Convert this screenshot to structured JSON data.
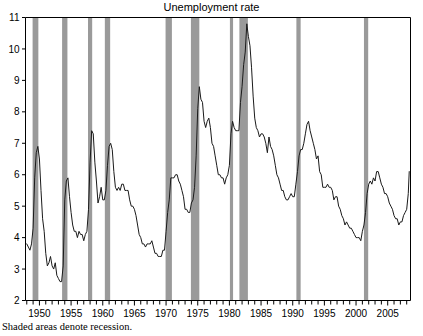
{
  "chart_title": "Unemployment rate",
  "caption": "Shaded areas denote recession.",
  "chart_data": {
    "type": "line",
    "title": "Unemployment rate",
    "subtitle": "",
    "xlabel": "",
    "ylabel": "",
    "xlim": [
      1947.8,
      2008.6
    ],
    "ylim": [
      2,
      11
    ],
    "grid": false,
    "legend": null,
    "annotations": [
      "Shaded areas denote recession."
    ],
    "y_ticks": [
      2,
      3,
      4,
      5,
      6,
      7,
      8,
      9,
      10,
      11
    ],
    "y_tick_labels": [
      "2",
      "3",
      "4",
      "5",
      "6",
      "7",
      "8",
      "9",
      "10",
      "11"
    ],
    "x_ticks_major": [
      1950,
      1955,
      1960,
      1965,
      1970,
      1975,
      1980,
      1985,
      1990,
      1995,
      2000,
      2005
    ],
    "x_tick_labels": [
      "1950",
      "1955",
      "1960",
      "1965",
      "1970",
      "1975",
      "1980",
      "1985",
      "1990",
      "1995",
      "2000",
      "2005"
    ],
    "x_minor_tick_interval": 1,
    "line_color": "#1a1a1a",
    "shade_color": "#9a9a9a",
    "axis_color": "#000000",
    "background_color": "#ffffff",
    "recession_bands": [
      {
        "label": "1948-49",
        "start": 1948.92,
        "end": 1949.83
      },
      {
        "label": "1953-54",
        "start": 1953.58,
        "end": 1954.42
      },
      {
        "label": "1957-58",
        "start": 1957.67,
        "end": 1958.33
      },
      {
        "label": "1960-61",
        "start": 1960.33,
        "end": 1961.17
      },
      {
        "label": "1969-70",
        "start": 1969.92,
        "end": 1970.92
      },
      {
        "label": "1973-75",
        "start": 1973.92,
        "end": 1975.25
      },
      {
        "label": "1980",
        "start": 1980.08,
        "end": 1980.58
      },
      {
        "label": "1981-82",
        "start": 1981.58,
        "end": 1982.92
      },
      {
        "label": "1990-91",
        "start": 1990.58,
        "end": 1991.25
      },
      {
        "label": "2001",
        "start": 2001.25,
        "end": 2001.92
      }
    ],
    "series": [
      {
        "name": "Unemployment rate",
        "x": [
          1948.0,
          1948.25,
          1948.5,
          1948.75,
          1949.0,
          1949.25,
          1949.5,
          1949.75,
          1950.0,
          1950.25,
          1950.5,
          1950.75,
          1951.0,
          1951.25,
          1951.5,
          1951.75,
          1952.0,
          1952.25,
          1952.5,
          1952.75,
          1953.0,
          1953.25,
          1953.5,
          1953.75,
          1954.0,
          1954.25,
          1954.5,
          1954.75,
          1955.0,
          1955.25,
          1955.5,
          1955.75,
          1956.0,
          1956.25,
          1956.5,
          1956.75,
          1957.0,
          1957.25,
          1957.5,
          1957.75,
          1958.0,
          1958.25,
          1958.5,
          1958.75,
          1959.0,
          1959.25,
          1959.5,
          1959.75,
          1960.0,
          1960.25,
          1960.5,
          1960.75,
          1961.0,
          1961.25,
          1961.5,
          1961.75,
          1962.0,
          1962.25,
          1962.5,
          1962.75,
          1963.0,
          1963.25,
          1963.5,
          1963.75,
          1964.0,
          1964.25,
          1964.5,
          1964.75,
          1965.0,
          1965.25,
          1965.5,
          1965.75,
          1966.0,
          1966.25,
          1966.5,
          1966.75,
          1967.0,
          1967.25,
          1967.5,
          1967.75,
          1968.0,
          1968.25,
          1968.5,
          1968.75,
          1969.0,
          1969.25,
          1969.5,
          1969.75,
          1970.0,
          1970.25,
          1970.5,
          1970.75,
          1971.0,
          1971.25,
          1971.5,
          1971.75,
          1972.0,
          1972.25,
          1972.5,
          1972.75,
          1973.0,
          1973.25,
          1973.5,
          1973.75,
          1974.0,
          1974.25,
          1974.5,
          1974.75,
          1975.0,
          1975.25,
          1975.5,
          1975.75,
          1976.0,
          1976.25,
          1976.5,
          1976.75,
          1977.0,
          1977.25,
          1977.5,
          1977.75,
          1978.0,
          1978.25,
          1978.5,
          1978.75,
          1979.0,
          1979.25,
          1979.5,
          1979.75,
          1980.0,
          1980.25,
          1980.5,
          1980.75,
          1981.0,
          1981.25,
          1981.5,
          1981.75,
          1982.0,
          1982.25,
          1982.5,
          1982.75,
          1983.0,
          1983.25,
          1983.5,
          1983.75,
          1984.0,
          1984.25,
          1984.5,
          1984.75,
          1985.0,
          1985.25,
          1985.5,
          1985.75,
          1986.0,
          1986.25,
          1986.5,
          1986.75,
          1987.0,
          1987.25,
          1987.5,
          1987.75,
          1988.0,
          1988.25,
          1988.5,
          1988.75,
          1989.0,
          1989.25,
          1989.5,
          1989.75,
          1990.0,
          1990.25,
          1990.5,
          1990.75,
          1991.0,
          1991.25,
          1991.5,
          1991.75,
          1992.0,
          1992.25,
          1992.5,
          1992.75,
          1993.0,
          1993.25,
          1993.5,
          1993.75,
          1994.0,
          1994.25,
          1994.5,
          1994.75,
          1995.0,
          1995.25,
          1995.5,
          1995.75,
          1996.0,
          1996.25,
          1996.5,
          1996.75,
          1997.0,
          1997.25,
          1997.5,
          1997.75,
          1998.0,
          1998.25,
          1998.5,
          1998.75,
          1999.0,
          1999.25,
          1999.5,
          1999.75,
          2000.0,
          2000.25,
          2000.5,
          2000.75,
          2001.0,
          2001.25,
          2001.5,
          2001.75,
          2002.0,
          2002.25,
          2002.5,
          2002.75,
          2003.0,
          2003.25,
          2003.5,
          2003.75,
          2004.0,
          2004.25,
          2004.5,
          2004.75,
          2005.0,
          2005.25,
          2005.5,
          2005.75,
          2006.0,
          2006.25,
          2006.5,
          2006.75,
          2007.0,
          2007.25,
          2007.5,
          2007.75,
          2008.0,
          2008.25,
          2008.4
        ],
        "values": [
          3.8,
          3.7,
          3.6,
          3.8,
          4.3,
          5.9,
          6.7,
          6.9,
          6.5,
          5.5,
          4.6,
          4.2,
          3.5,
          3.1,
          3.2,
          3.4,
          3.1,
          3.0,
          3.2,
          2.8,
          2.7,
          2.6,
          2.6,
          3.1,
          5.2,
          5.8,
          5.9,
          5.3,
          4.8,
          4.4,
          4.2,
          4.2,
          4.0,
          4.2,
          4.1,
          4.1,
          3.9,
          4.1,
          4.2,
          4.9,
          6.4,
          7.4,
          7.3,
          6.4,
          5.8,
          5.1,
          5.3,
          5.6,
          5.2,
          5.2,
          5.5,
          6.3,
          6.9,
          7.0,
          6.8,
          6.1,
          5.6,
          5.5,
          5.6,
          5.5,
          5.7,
          5.7,
          5.5,
          5.5,
          5.5,
          5.2,
          5.0,
          5.0,
          4.9,
          4.7,
          4.4,
          4.1,
          4.0,
          3.8,
          3.8,
          3.7,
          3.8,
          3.8,
          3.8,
          3.9,
          3.7,
          3.5,
          3.5,
          3.4,
          3.4,
          3.4,
          3.6,
          3.6,
          4.2,
          4.8,
          5.2,
          5.9,
          5.9,
          5.9,
          6.0,
          6.0,
          5.8,
          5.7,
          5.5,
          5.3,
          4.9,
          4.9,
          4.8,
          4.8,
          5.1,
          5.2,
          5.6,
          6.6,
          8.1,
          8.8,
          8.4,
          8.3,
          7.7,
          7.5,
          7.7,
          7.8,
          7.5,
          7.0,
          6.9,
          6.6,
          6.3,
          6.0,
          6.0,
          5.9,
          5.9,
          5.7,
          5.9,
          6.0,
          6.3,
          7.3,
          7.7,
          7.5,
          7.4,
          7.4,
          7.4,
          8.3,
          8.8,
          9.5,
          9.9,
          10.8,
          10.4,
          10.1,
          9.4,
          8.5,
          7.8,
          7.5,
          7.4,
          7.2,
          7.3,
          7.3,
          7.2,
          7.0,
          6.7,
          7.2,
          6.9,
          6.8,
          6.6,
          6.3,
          6.0,
          5.9,
          5.7,
          5.5,
          5.5,
          5.3,
          5.2,
          5.2,
          5.3,
          5.4,
          5.3,
          5.3,
          5.7,
          6.1,
          6.6,
          6.8,
          6.8,
          7.0,
          7.3,
          7.6,
          7.7,
          7.4,
          7.2,
          7.0,
          6.8,
          6.5,
          6.6,
          6.1,
          6.0,
          5.6,
          5.6,
          5.6,
          5.7,
          5.6,
          5.6,
          5.5,
          5.2,
          5.3,
          5.3,
          5.0,
          4.9,
          4.7,
          4.6,
          4.4,
          4.5,
          4.4,
          4.3,
          4.3,
          4.2,
          4.1,
          4.0,
          4.0,
          4.0,
          3.9,
          4.2,
          4.4,
          4.8,
          5.4,
          5.7,
          5.8,
          5.7,
          5.9,
          5.8,
          6.1,
          6.1,
          5.9,
          5.7,
          5.6,
          5.4,
          5.4,
          5.3,
          5.1,
          5.0,
          4.9,
          4.7,
          4.6,
          4.6,
          4.4,
          4.5,
          4.5,
          4.7,
          4.8,
          4.9,
          5.4,
          6.1
        ]
      }
    ]
  }
}
